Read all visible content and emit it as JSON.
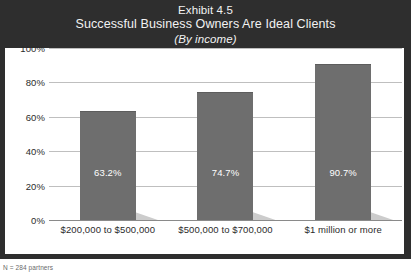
{
  "exhibit": {
    "number_line": "Exhibit 4.5",
    "title": "Successful Business Owners Are Ideal Clients",
    "subtitle": "(By income)",
    "footnote": "N = 284 partners"
  },
  "colors": {
    "header_background": "#2e2e2e",
    "header_text": "#f2f2f2",
    "plot_background": "#ffffff",
    "bar_fill": "#6e6e6e",
    "bar_shadow": "#cccccc",
    "gridline": "#bfbfbf",
    "axis_line": "#8a8a8a",
    "tick_text": "#2b2b2b",
    "value_label_text": "#ffffff"
  },
  "chart_data": {
    "type": "bar",
    "title": "Successful Business Owners Are Ideal Clients",
    "subtitle": "(By income)",
    "xlabel": "",
    "ylabel": "",
    "ylim": [
      0,
      100
    ],
    "yticks": [
      0,
      20,
      40,
      60,
      80,
      100
    ],
    "ytick_labels": [
      "0%",
      "20%",
      "40%",
      "60%",
      "80%",
      "100%"
    ],
    "grid": true,
    "legend": false,
    "orientation": "vertical",
    "categories": [
      "$200,000 to $500,000",
      "$500,000 to $700,000",
      "$1 million or more"
    ],
    "values": [
      63.2,
      74.7,
      90.7
    ],
    "data_labels": [
      "63.2%",
      "74.7%",
      "90.7%"
    ]
  }
}
